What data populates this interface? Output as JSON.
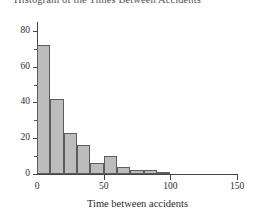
{
  "chart_data": {
    "type": "bar",
    "title": "Histogram of the Times Between Accidents",
    "xlabel": "Time between accidents",
    "ylabel": "",
    "grid": false,
    "legend": false,
    "xlim": [
      0,
      150
    ],
    "ylim": [
      0,
      85
    ],
    "bin_width": 10,
    "x_ticks": [
      0,
      50,
      100,
      150
    ],
    "x_tick_labels": [
      "0",
      "50",
      "100",
      "150"
    ],
    "y_ticks": [
      0,
      20,
      40,
      60,
      80
    ],
    "y_tick_labels": [
      "0",
      "20",
      "40",
      "60",
      "80"
    ],
    "y_minor_ticks": [
      10,
      30,
      50,
      70
    ],
    "bar_color": "#b9b9b9",
    "bar_edge_color": "#555555",
    "axis_color": "#3a3a3a",
    "bins": [
      {
        "start": 0,
        "end": 10,
        "value": 72
      },
      {
        "start": 10,
        "end": 20,
        "value": 42
      },
      {
        "start": 20,
        "end": 30,
        "value": 23
      },
      {
        "start": 30,
        "end": 40,
        "value": 16
      },
      {
        "start": 40,
        "end": 50,
        "value": 6
      },
      {
        "start": 50,
        "end": 60,
        "value": 10
      },
      {
        "start": 60,
        "end": 70,
        "value": 4
      },
      {
        "start": 70,
        "end": 80,
        "value": 2
      },
      {
        "start": 80,
        "end": 90,
        "value": 2
      },
      {
        "start": 90,
        "end": 100,
        "value": 1
      },
      {
        "start": 100,
        "end": 110,
        "value": 0
      },
      {
        "start": 110,
        "end": 120,
        "value": 0
      },
      {
        "start": 120,
        "end": 130,
        "value": 0
      },
      {
        "start": 130,
        "end": 140,
        "value": 0
      },
      {
        "start": 140,
        "end": 150,
        "value": 0
      }
    ],
    "categories": [
      "0-10",
      "10-20",
      "20-30",
      "30-40",
      "40-50",
      "50-60",
      "60-70",
      "70-80",
      "80-90",
      "90-100",
      "100-110",
      "110-120",
      "120-130",
      "130-140",
      "140-150"
    ],
    "values": [
      72,
      42,
      23,
      16,
      6,
      10,
      4,
      2,
      2,
      1,
      0,
      0,
      0,
      0,
      0
    ]
  }
}
